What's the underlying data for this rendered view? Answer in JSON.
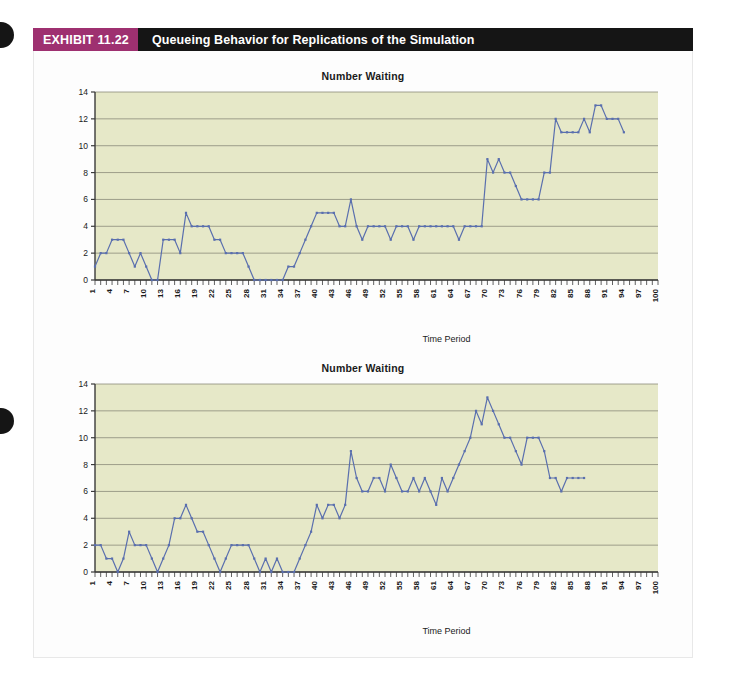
{
  "exhibit": {
    "number_label": "EXHIBIT 11.22",
    "title": "Queueing Behavior for Replications of the Simulation",
    "number_bg": "#9e3070",
    "title_bg": "#151515",
    "title_fg": "#ffffff"
  },
  "page": {
    "background": "#ffffff",
    "card_background": "#fdfdfd",
    "hole_color": "#151515"
  },
  "charts": [
    {
      "id": "replication-1",
      "title": "Number Waiting",
      "xlabel": "Time Period",
      "ylabel": "",
      "plot_bg": "#e6e8c8",
      "line_color": "#5a6fae",
      "grid_color": "#8a8a7a"
    },
    {
      "id": "replication-2",
      "title": "Number Waiting",
      "xlabel": "Time Period",
      "ylabel": "",
      "plot_bg": "#e6e8c8",
      "line_color": "#5a6fae",
      "grid_color": "#8a8a7a"
    }
  ],
  "chart_data": [
    {
      "type": "line",
      "title": "Number Waiting",
      "xlabel": "Time Period",
      "ylabel": "",
      "ylim": [
        0,
        14
      ],
      "yticks": [
        0,
        2,
        4,
        6,
        8,
        10,
        12,
        14
      ],
      "xlim": [
        1,
        100
      ],
      "xticks": [
        1,
        4,
        7,
        10,
        13,
        16,
        19,
        22,
        25,
        28,
        31,
        34,
        37,
        40,
        43,
        46,
        49,
        52,
        55,
        58,
        61,
        64,
        67,
        70,
        73,
        76,
        79,
        82,
        85,
        88,
        91,
        94,
        97,
        100
      ],
      "grid": true,
      "legend": "none",
      "series": [
        {
          "name": "Number Waiting",
          "x": [
            1,
            2,
            3,
            4,
            5,
            6,
            7,
            8,
            9,
            10,
            11,
            12,
            13,
            14,
            15,
            16,
            17,
            18,
            19,
            20,
            21,
            22,
            23,
            24,
            25,
            26,
            27,
            28,
            29,
            30,
            31,
            32,
            33,
            34,
            35,
            36,
            37,
            38,
            39,
            40,
            41,
            42,
            43,
            44,
            45,
            46,
            47,
            48,
            49,
            50,
            51,
            52,
            53,
            54,
            55,
            56,
            57,
            58,
            59,
            60,
            61,
            62,
            63,
            64,
            65,
            66,
            67,
            68,
            69,
            70,
            71,
            72,
            73,
            74,
            75,
            76,
            77,
            78,
            79,
            80,
            81,
            82,
            83,
            84,
            85,
            86,
            87,
            88,
            89,
            90,
            91,
            92,
            93,
            94,
            95,
            96,
            97,
            98,
            99,
            100
          ],
          "values": [
            1,
            2,
            2,
            3,
            3,
            3,
            2,
            1,
            2,
            1,
            0,
            0,
            3,
            3,
            3,
            2,
            5,
            4,
            4,
            4,
            4,
            3,
            3,
            2,
            2,
            2,
            2,
            1,
            0,
            0,
            0,
            0,
            0,
            0,
            1,
            1,
            2,
            3,
            4,
            5,
            5,
            5,
            5,
            4,
            4,
            6,
            4,
            3,
            4,
            4,
            4,
            4,
            3,
            4,
            4,
            4,
            3,
            4,
            4,
            4,
            4,
            4,
            4,
            4,
            3,
            4,
            4,
            4,
            4,
            9,
            8,
            9,
            8,
            8,
            7,
            6,
            6,
            6,
            6,
            8,
            8,
            12,
            11,
            11,
            11,
            11,
            12,
            11,
            13,
            13,
            12,
            12,
            12,
            11
          ]
        }
      ]
    },
    {
      "type": "line",
      "title": "Number Waiting",
      "xlabel": "Time Period",
      "ylabel": "",
      "ylim": [
        0,
        14
      ],
      "yticks": [
        0,
        2,
        4,
        6,
        8,
        10,
        12,
        14
      ],
      "xlim": [
        1,
        100
      ],
      "xticks": [
        1,
        4,
        7,
        10,
        13,
        16,
        19,
        22,
        25,
        28,
        31,
        34,
        37,
        40,
        43,
        46,
        49,
        52,
        55,
        58,
        61,
        64,
        67,
        70,
        73,
        76,
        79,
        82,
        85,
        88,
        91,
        94,
        97,
        100
      ],
      "grid": true,
      "legend": "none",
      "series": [
        {
          "name": "Number Waiting",
          "x": [
            1,
            2,
            3,
            4,
            5,
            6,
            7,
            8,
            9,
            10,
            11,
            12,
            13,
            14,
            15,
            16,
            17,
            18,
            19,
            20,
            21,
            22,
            23,
            24,
            25,
            26,
            27,
            28,
            29,
            30,
            31,
            32,
            33,
            34,
            35,
            36,
            37,
            38,
            39,
            40,
            41,
            42,
            43,
            44,
            45,
            46,
            47,
            48,
            49,
            50,
            51,
            52,
            53,
            54,
            55,
            56,
            57,
            58,
            59,
            60,
            61,
            62,
            63,
            64,
            65,
            66,
            67,
            68,
            69,
            70,
            71,
            72,
            73,
            74,
            75,
            76,
            77,
            78,
            79,
            80,
            81,
            82,
            83,
            84,
            85,
            86,
            87,
            88,
            89,
            90,
            91,
            92,
            93,
            94,
            95,
            96,
            97,
            98,
            99,
            100
          ],
          "values": [
            2,
            2,
            1,
            1,
            0,
            1,
            3,
            2,
            2,
            2,
            1,
            0,
            1,
            2,
            4,
            4,
            5,
            4,
            3,
            3,
            2,
            1,
            0,
            1,
            2,
            2,
            2,
            2,
            1,
            0,
            1,
            0,
            1,
            0,
            0,
            0,
            1,
            2,
            3,
            5,
            4,
            5,
            5,
            4,
            5,
            9,
            7,
            6,
            6,
            7,
            7,
            6,
            8,
            7,
            6,
            6,
            7,
            6,
            7,
            6,
            5,
            7,
            6,
            7,
            8,
            9,
            10,
            12,
            11,
            13,
            12,
            11,
            10,
            10,
            9,
            8,
            10,
            10,
            10,
            9,
            7,
            7,
            6,
            7,
            7,
            7,
            7
          ]
        }
      ]
    }
  ]
}
